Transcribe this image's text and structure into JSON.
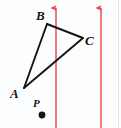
{
  "figure": {
    "type": "geometry-physics-diagram",
    "width": 121,
    "height": 128,
    "background_color": "#fcfdff"
  },
  "labels": {
    "a": "A",
    "b": "B",
    "c": "C",
    "p": "P"
  },
  "colors": {
    "field_line": "#e8424a",
    "triangle_stroke": "#141414",
    "point_fill": "#141414",
    "background": "#fcfdff",
    "edge_rule": "#f0e2dc"
  },
  "chart_data": {
    "type": "scatter",
    "title": "",
    "xlabel": "",
    "ylabel": "",
    "xlim": [
      0,
      121
    ],
    "ylim": [
      0,
      128
    ],
    "grid": false,
    "legend": null,
    "y_axis_inverted": true,
    "points": [
      {
        "label": "A",
        "x": 24,
        "y": 88,
        "kind": "triangle-vertex",
        "label_x": 13,
        "label_y": 95
      },
      {
        "label": "B",
        "x": 47,
        "y": 24,
        "kind": "triangle-vertex",
        "label_x": 40,
        "label_y": 17
      },
      {
        "label": "C",
        "x": 83,
        "y": 38,
        "kind": "triangle-vertex",
        "label_x": 90,
        "label_y": 42
      },
      {
        "label": "P",
        "x": 42,
        "y": 115,
        "kind": "marked-point",
        "label_x": 36,
        "label_y": 104,
        "radius": 3.4
      }
    ],
    "series": [
      {
        "name": "triangle ABC",
        "kind": "closed-polygon",
        "stroke": "#141414",
        "stroke_width": 1.9,
        "vertices": [
          {
            "label": "A",
            "x": 24,
            "y": 88
          },
          {
            "label": "B",
            "x": 47,
            "y": 24
          },
          {
            "label": "C",
            "x": 83,
            "y": 38
          }
        ],
        "edges": [
          "AB",
          "BC",
          "CA"
        ]
      },
      {
        "name": "field lines",
        "kind": "vertical-arrows",
        "stroke": "#e8424a",
        "stroke_width": 1.4,
        "direction": "up",
        "arrows": [
          {
            "x": 56,
            "y_start": 128,
            "y_end": 2
          },
          {
            "x": 101,
            "y_start": 128,
            "y_end": 2
          }
        ]
      }
    ],
    "annotations": [
      {
        "text": "A",
        "x": 13,
        "y": 95,
        "style": "italic-serif-bold"
      },
      {
        "text": "B",
        "x": 40,
        "y": 17,
        "style": "italic-serif-bold"
      },
      {
        "text": "C",
        "x": 90,
        "y": 42,
        "style": "italic-serif-bold"
      },
      {
        "text": "P",
        "x": 36,
        "y": 104,
        "style": "italic-serif-bold"
      }
    ]
  }
}
